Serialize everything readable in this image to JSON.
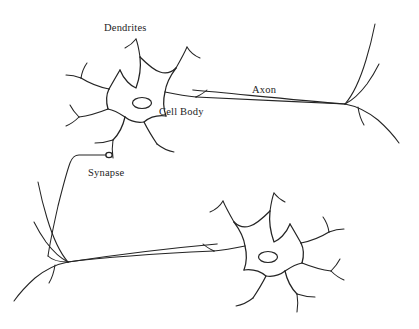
{
  "diagram": {
    "type": "biological-schematic",
    "background_color": "#ffffff",
    "stroke_color": "#242424",
    "width": 419,
    "height": 329,
    "labels": [
      {
        "id": "dendrites",
        "text": "Dendrites",
        "x": 104,
        "y": 22,
        "points_to": "upper-neuron-dendrites"
      },
      {
        "id": "cell_body",
        "text": "Cell Body",
        "x": 159,
        "y": 106,
        "points_to": "upper-neuron-soma"
      },
      {
        "id": "axon",
        "text": "Axon",
        "x": 252,
        "y": 84,
        "points_to": "upper-neuron-axon"
      },
      {
        "id": "synapse",
        "text": "Synapse",
        "x": 88,
        "y": 167,
        "points_to": "synapse-terminal"
      }
    ],
    "parts": [
      {
        "id": "upper-neuron",
        "name": "Upper neuron",
        "orientation": "axon-right"
      },
      {
        "id": "lower-neuron",
        "name": "Lower neuron",
        "orientation": "axon-left"
      },
      {
        "id": "synapse-terminal",
        "name": "Synaptic terminal bulb"
      }
    ],
    "upper_neuron": {
      "soma_center": {
        "x": 142,
        "y": 103
      },
      "nucleus": {
        "cx": 142,
        "cy": 103,
        "rx": 9.5,
        "ry": 5.5
      },
      "axon_terminal": {
        "x": 345,
        "y": 104
      },
      "dendrite_count": 7
    },
    "lower_neuron": {
      "soma_center": {
        "x": 268,
        "y": 257
      },
      "nucleus": {
        "cx": 268,
        "cy": 257,
        "rx": 9.5,
        "ry": 5.5
      },
      "axon_terminal": {
        "x": 68,
        "y": 262
      },
      "dendrite_count": 7
    }
  }
}
